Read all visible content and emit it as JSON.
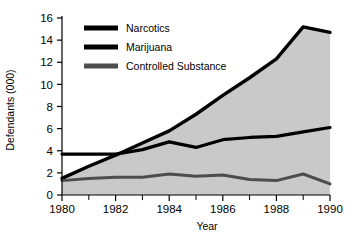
{
  "chart_data": {
    "type": "area",
    "title": "",
    "subtitle": "",
    "xlabel": "Year",
    "ylabel": "Defendants (000)",
    "xlim": [
      1980,
      1990
    ],
    "ylim": [
      0,
      16
    ],
    "ytick_step": 2,
    "yticks": [
      "0",
      "2",
      "4",
      "6",
      "8",
      "10",
      "12",
      "14",
      "16"
    ],
    "xticks": [
      "1980",
      "1982",
      "1984",
      "1986",
      "1988",
      "1990"
    ],
    "xticks_minor": [
      "1981",
      "1983",
      "1985",
      "1987",
      "1989"
    ],
    "x": [
      1980,
      1981,
      1982,
      1983,
      1984,
      1985,
      1986,
      1987,
      1988,
      1989,
      1990
    ],
    "grid": false,
    "legend_position": "top-center",
    "stacked": false,
    "series": [
      {
        "name": "Narcotics",
        "color": "#000000",
        "values": [
          1.5,
          2.6,
          3.6,
          4.7,
          5.8,
          7.3,
          9.0,
          10.6,
          12.3,
          15.2,
          14.7
        ]
      },
      {
        "name": "Marijuana",
        "color": "#000000",
        "values": [
          3.7,
          3.7,
          3.7,
          4.1,
          4.8,
          4.3,
          5.0,
          5.2,
          5.3,
          5.7,
          6.1
        ]
      },
      {
        "name": "Controlled Substance",
        "color": "#4d4d4d",
        "values": [
          1.3,
          1.5,
          1.6,
          1.6,
          1.9,
          1.7,
          1.8,
          1.4,
          1.3,
          1.9,
          1.0
        ]
      }
    ],
    "fill_color": "#c9c9c9",
    "axis_color": "#000000"
  },
  "legend": {
    "entries": [
      {
        "label": "Narcotics",
        "swatch": "#000000"
      },
      {
        "label": "Marijuana",
        "swatch": "#000000"
      },
      {
        "label": "Controlled Substance",
        "swatch": "#4d4d4d"
      }
    ]
  }
}
